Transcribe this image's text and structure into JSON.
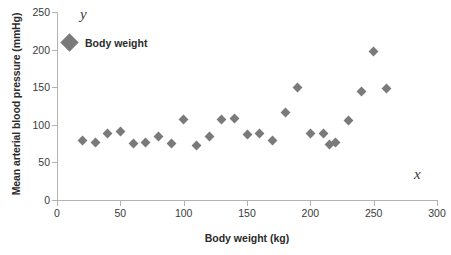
{
  "chart_data": {
    "type": "scatter",
    "title": "",
    "xlabel": "Body weight (kg)",
    "ylabel": "Mean arterial blood pressure (mmHg)",
    "xlim": [
      0,
      300
    ],
    "ylim": [
      0,
      250
    ],
    "xticks": [
      0,
      50,
      100,
      150,
      200,
      250,
      300
    ],
    "yticks": [
      0,
      50,
      100,
      150,
      200,
      250
    ],
    "grid": false,
    "legend_position": "inside-top-left",
    "marker_shape": "diamond",
    "marker_color": "#7a7a7a",
    "axis_letter_y": "y",
    "axis_letter_x": "x",
    "series": [
      {
        "name": "Body weight",
        "color": "#7a7a7a",
        "points": [
          {
            "x": 20,
            "y": 79
          },
          {
            "x": 30,
            "y": 77
          },
          {
            "x": 40,
            "y": 89
          },
          {
            "x": 50,
            "y": 91
          },
          {
            "x": 60,
            "y": 75
          },
          {
            "x": 70,
            "y": 77
          },
          {
            "x": 80,
            "y": 85
          },
          {
            "x": 90,
            "y": 75
          },
          {
            "x": 100,
            "y": 107
          },
          {
            "x": 110,
            "y": 73
          },
          {
            "x": 120,
            "y": 84
          },
          {
            "x": 130,
            "y": 107
          },
          {
            "x": 140,
            "y": 108
          },
          {
            "x": 150,
            "y": 87
          },
          {
            "x": 160,
            "y": 89
          },
          {
            "x": 170,
            "y": 79
          },
          {
            "x": 180,
            "y": 117
          },
          {
            "x": 190,
            "y": 149
          },
          {
            "x": 200,
            "y": 88
          },
          {
            "x": 210,
            "y": 89
          },
          {
            "x": 215,
            "y": 74
          },
          {
            "x": 220,
            "y": 77
          },
          {
            "x": 230,
            "y": 106
          },
          {
            "x": 240,
            "y": 144
          },
          {
            "x": 250,
            "y": 197
          },
          {
            "x": 260,
            "y": 148
          }
        ]
      }
    ]
  },
  "legend": {
    "items": [
      {
        "label": "Body weight"
      }
    ]
  }
}
